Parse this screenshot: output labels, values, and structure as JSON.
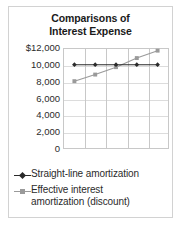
{
  "chart_data": {
    "type": "line",
    "title": "Comparisons of Interest Expense",
    "title_lines": [
      "Comparisons of",
      "Interest Expense"
    ],
    "xlabel": "",
    "ylabel": "",
    "ylim": [
      0,
      12000
    ],
    "ytick_labels": [
      "$12,000",
      "10,000",
      "8,000",
      "6,000",
      "4,000",
      "2,000",
      "0"
    ],
    "ytick_values": [
      12000,
      10000,
      8000,
      6000,
      4000,
      2000,
      0
    ],
    "x": [
      1,
      2,
      3,
      4,
      5
    ],
    "xtick_labels": [
      "",
      "",
      "",
      "",
      ""
    ],
    "grid": true,
    "legend_position": "bottom-left",
    "series": [
      {
        "name": "Straight-line amortization",
        "name_lines": [
          "Straight-line amortization"
        ],
        "values": [
          10100,
          10100,
          10100,
          10100,
          10100
        ],
        "color": "#2a2a2a",
        "marker": "diamond"
      },
      {
        "name": "Effective interest amortization (discount)",
        "name_lines": [
          "Effective interest",
          "amortization (discount)"
        ],
        "values": [
          8100,
          8900,
          9800,
          10900,
          11800
        ],
        "color": "#9a9a9a",
        "marker": "square"
      }
    ]
  },
  "style": {
    "background": "#ffffff",
    "frame_border": "#d2d2d2",
    "plot_border": "#c8c8c8",
    "gridline": "#dcdcdc",
    "text": "#2b2b2b",
    "title_color": "#1a1a1a"
  }
}
